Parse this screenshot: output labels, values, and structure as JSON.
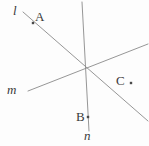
{
  "figure": {
    "width": 149,
    "height": 146,
    "background_color": "#fdfdfd",
    "line_color": "#8a8a8a",
    "label_color": "#3a3a3a",
    "point_color": "#4a4a4a"
  },
  "labels": {
    "line_l": "l",
    "line_m": "m",
    "line_n": "n",
    "point_a": "A",
    "point_b": "B",
    "point_c": "C"
  },
  "chart_data": {
    "type": "scatter",
    "title": "",
    "xlabel": "",
    "ylabel": "",
    "xlim": [
      0,
      149
    ],
    "ylim": [
      0,
      146
    ],
    "grid": false,
    "legend": "none",
    "intersection": {
      "x": 85.5,
      "y": 68.5
    },
    "lines": [
      {
        "name": "l",
        "label": "l",
        "label_x": 13,
        "label_y": 4,
        "x1": 23,
        "y1": 12,
        "x2": 148,
        "y2": 121,
        "style": "solid",
        "color": "#8a8a8a",
        "width": 0.9
      },
      {
        "name": "m",
        "label": "m",
        "label_x": 7,
        "label_y": 83,
        "x1": 28,
        "y1": 91,
        "x2": 148,
        "y2": 44,
        "style": "solid",
        "color": "#8a8a8a",
        "width": 0.9
      },
      {
        "name": "n",
        "label": "n",
        "label_x": 84,
        "label_y": 129,
        "x1": 82,
        "y1": 2,
        "x2": 89,
        "y2": 131,
        "style": "solid",
        "color": "#8a8a8a",
        "width": 0.9
      }
    ],
    "points": [
      {
        "name": "A",
        "label": "A",
        "x": 33,
        "y": 23,
        "on_line": "l",
        "label_x": 35,
        "label_y": 10,
        "marker": "square-dot",
        "marker_size": 2.4
      },
      {
        "name": "B",
        "label": "B",
        "x": 88,
        "y": 117,
        "on_line": "n",
        "label_x": 76,
        "label_y": 110,
        "marker": "square-dot",
        "marker_size": 2.4
      },
      {
        "name": "C",
        "label": "C",
        "x": 131,
        "y": 83,
        "on_line": null,
        "label_x": 116,
        "label_y": 74,
        "marker": "square-dot",
        "marker_size": 2.4
      }
    ]
  }
}
